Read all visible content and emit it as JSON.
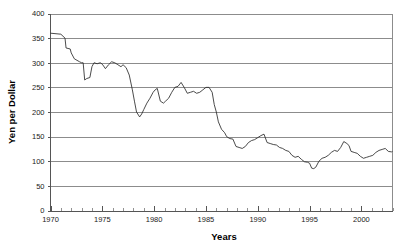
{
  "chart_data": {
    "type": "line",
    "title": "",
    "xlabel": "Years",
    "ylabel": "Yen per Dollar",
    "xlim": [
      1970,
      2003
    ],
    "ylim": [
      0,
      400
    ],
    "grid": true,
    "legend_position": "none",
    "y_ticks": [
      0,
      50,
      100,
      150,
      200,
      250,
      300,
      350,
      400
    ],
    "y_tick_labels": [
      "0",
      "50",
      "100",
      "150",
      "200",
      "250",
      "300",
      "350",
      "400"
    ],
    "x_ticks": [
      1970,
      1975,
      1980,
      1985,
      1990,
      1995,
      2000
    ],
    "x_tick_labels": [
      "1970",
      "1975",
      "1980",
      "1985",
      "1990",
      "1995",
      "2000"
    ],
    "x_minor_ticks": [
      1971,
      1972,
      1973,
      1974,
      1976,
      1977,
      1978,
      1979,
      1981,
      1982,
      1983,
      1984,
      1986,
      1987,
      1988,
      1989,
      1991,
      1992,
      1993,
      1994,
      1996,
      1997,
      1998,
      1999,
      2001,
      2002,
      2003
    ],
    "series": [
      {
        "name": "Yen per Dollar",
        "color": "#2b2b2b",
        "x": [
          1970.0,
          1971.0,
          1971.4,
          1971.5,
          1971.9,
          1972.0,
          1972.3,
          1972.8,
          1973.0,
          1973.15,
          1973.3,
          1973.5,
          1973.8,
          1974.0,
          1974.2,
          1974.5,
          1974.8,
          1975.0,
          1975.3,
          1975.6,
          1975.9,
          1976.2,
          1976.5,
          1976.8,
          1977.0,
          1977.3,
          1977.6,
          1977.9,
          1978.1,
          1978.3,
          1978.6,
          1978.8,
          1979.0,
          1979.3,
          1979.6,
          1979.9,
          1980.1,
          1980.3,
          1980.6,
          1980.9,
          1981.1,
          1981.4,
          1981.7,
          1982.0,
          1982.3,
          1982.6,
          1982.9,
          1983.2,
          1983.5,
          1983.8,
          1984.1,
          1984.4,
          1984.7,
          1985.0,
          1985.3,
          1985.6,
          1985.8,
          1986.0,
          1986.2,
          1986.5,
          1986.8,
          1987.0,
          1987.3,
          1987.6,
          1987.9,
          1988.2,
          1988.5,
          1988.8,
          1989.1,
          1989.4,
          1989.7,
          1990.0,
          1990.3,
          1990.6,
          1990.9,
          1991.2,
          1991.5,
          1991.8,
          1992.1,
          1992.4,
          1992.7,
          1993.0,
          1993.3,
          1993.6,
          1993.9,
          1994.2,
          1994.5,
          1994.8,
          1995.0,
          1995.2,
          1995.4,
          1995.6,
          1995.9,
          1996.2,
          1996.5,
          1996.8,
          1997.1,
          1997.4,
          1997.7,
          1998.0,
          1998.3,
          1998.6,
          1998.8,
          1999.0,
          1999.3,
          1999.6,
          1999.9,
          2000.2,
          2000.5,
          2000.8,
          2001.1,
          2001.4,
          2001.7,
          2002.0,
          2002.3,
          2002.6,
          2002.9,
          2003.0
        ],
        "y": [
          360,
          358,
          350,
          330,
          328,
          320,
          308,
          302,
          300,
          300,
          265,
          268,
          270,
          292,
          300,
          298,
          300,
          297,
          288,
          296,
          302,
          300,
          296,
          292,
          296,
          290,
          275,
          245,
          222,
          200,
          190,
          196,
          205,
          218,
          228,
          240,
          245,
          248,
          222,
          218,
          222,
          228,
          240,
          250,
          252,
          260,
          250,
          238,
          240,
          242,
          238,
          240,
          245,
          250,
          250,
          240,
          215,
          200,
          180,
          165,
          158,
          150,
          146,
          145,
          130,
          128,
          126,
          130,
          138,
          142,
          144,
          148,
          152,
          155,
          138,
          136,
          134,
          133,
          128,
          126,
          122,
          120,
          112,
          108,
          110,
          104,
          99,
          98,
          96,
          86,
          85,
          88,
          100,
          106,
          108,
          112,
          118,
          122,
          120,
          128,
          140,
          136,
          132,
          120,
          118,
          116,
          110,
          106,
          108,
          110,
          112,
          118,
          122,
          124,
          126,
          120,
          119,
          120
        ]
      }
    ]
  }
}
